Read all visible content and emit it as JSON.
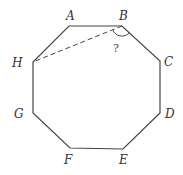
{
  "diagram": {
    "type": "regular-octagon",
    "stroke_color": "#444444",
    "vertices": [
      {
        "name": "A",
        "x": 69,
        "y": 26,
        "label_x": 66,
        "label_y": 20
      },
      {
        "name": "B",
        "x": 122,
        "y": 26,
        "label_x": 121,
        "label_y": 20
      },
      {
        "name": "C",
        "x": 160,
        "y": 61,
        "label_x": 164,
        "label_y": 66
      },
      {
        "name": "D",
        "x": 160,
        "y": 113,
        "label_x": 165,
        "label_y": 118
      },
      {
        "name": "E",
        "x": 123,
        "y": 149,
        "label_x": 119,
        "label_y": 164
      },
      {
        "name": "F",
        "x": 70,
        "y": 148,
        "label_x": 65,
        "label_y": 164
      },
      {
        "name": "G",
        "x": 33,
        "y": 113,
        "label_x": 15,
        "label_y": 118
      },
      {
        "name": "H",
        "x": 33,
        "y": 62,
        "label_x": 13,
        "label_y": 67
      }
    ],
    "dashed_segment": {
      "from": "B",
      "to": "H"
    },
    "angle_marker": {
      "vertex": "B",
      "between": [
        "H",
        "C"
      ],
      "label": "?"
    }
  }
}
